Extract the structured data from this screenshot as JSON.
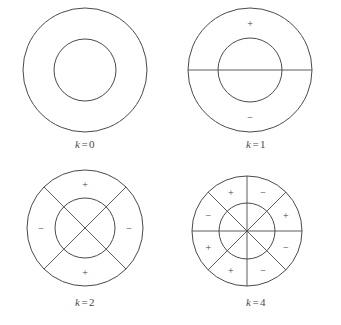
{
  "figure": {
    "type": "diagram",
    "background_color": "#ffffff",
    "line_color": "#4a4a4a",
    "text_color": "#3a3a3a"
  },
  "panels": [
    {
      "id": "panel-k0",
      "caption": {
        "variable": "k",
        "equals": "=",
        "value": "0",
        "full": "k = 0"
      },
      "geometry": {
        "cx": 85,
        "cy": 70,
        "outer_r": 62,
        "inner_r": 31
      },
      "nodal_diameters": 0,
      "diameter_angles_deg": [],
      "signs": []
    },
    {
      "id": "panel-k1",
      "caption": {
        "variable": "k",
        "equals": "=",
        "value": "1",
        "full": "k = 1"
      },
      "geometry": {
        "cx": 79,
        "cy": 70,
        "outer_r": 62,
        "inner_r": 32
      },
      "nodal_diameters": 1,
      "diameter_angles_deg": [
        0
      ],
      "signs": [
        {
          "label": "+",
          "angle_deg": 90,
          "radius": 47
        },
        {
          "label": "−",
          "angle_deg": 270,
          "radius": 47
        }
      ]
    },
    {
      "id": "panel-k2",
      "caption": {
        "variable": "k",
        "equals": "=",
        "value": "2",
        "full": "k = 2"
      },
      "geometry": {
        "cx": 85,
        "cy": 65,
        "outer_r": 58,
        "inner_r": 30
      },
      "nodal_diameters": 2,
      "diameter_angles_deg": [
        45,
        135
      ],
      "signs": [
        {
          "label": "+",
          "angle_deg": 90,
          "radius": 44
        },
        {
          "label": "−",
          "angle_deg": 180,
          "radius": 44
        },
        {
          "label": "−",
          "angle_deg": 0,
          "radius": 44
        },
        {
          "label": "+",
          "angle_deg": 270,
          "radius": 44
        }
      ]
    },
    {
      "id": "panel-k4",
      "caption": {
        "variable": "k",
        "equals": "=",
        "value": "4",
        "full": "k = 4"
      },
      "geometry": {
        "cx": 76,
        "cy": 68,
        "outer_r": 55,
        "inner_r": 28
      },
      "nodal_diameters": 4,
      "diameter_angles_deg": [
        0,
        45,
        90,
        135
      ],
      "signs": [
        {
          "label": "+",
          "angle_deg": 112.5,
          "radius": 42
        },
        {
          "label": "−",
          "angle_deg": 67.5,
          "radius": 42
        },
        {
          "label": "+",
          "angle_deg": 22.5,
          "radius": 42
        },
        {
          "label": "−",
          "angle_deg": 337.5,
          "radius": 42
        },
        {
          "label": "−",
          "angle_deg": 292.5,
          "radius": 42
        },
        {
          "label": "+",
          "angle_deg": 247.5,
          "radius": 42
        },
        {
          "label": "+",
          "angle_deg": 202.5,
          "radius": 42
        },
        {
          "label": "−",
          "angle_deg": 157.5,
          "radius": 42
        }
      ]
    }
  ]
}
